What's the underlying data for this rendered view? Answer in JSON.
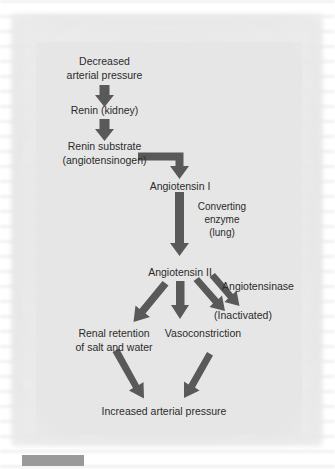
{
  "figure": {
    "type": "flowchart",
    "background_color": "#e6e6e6",
    "arrow_color": "#595959",
    "text_color": "#2b2b2b"
  },
  "nodes": [
    {
      "id": "n1",
      "lines": [
        "Decreased",
        "arterial pressure"
      ]
    },
    {
      "id": "n2",
      "lines": [
        "Renin (kidney)"
      ]
    },
    {
      "id": "n3",
      "lines": [
        "Renin substrate",
        "(angiotensinogen)"
      ]
    },
    {
      "id": "n4",
      "lines": [
        "Angiotensin I"
      ]
    },
    {
      "id": "n5",
      "lines": [
        "Converting",
        "enzyme",
        "(lung)"
      ]
    },
    {
      "id": "n6",
      "lines": [
        "Angiotensin II"
      ]
    },
    {
      "id": "n7",
      "lines": [
        "Angiotensinase"
      ]
    },
    {
      "id": "n8",
      "lines": [
        "(Inactivated)"
      ]
    },
    {
      "id": "n9",
      "lines": [
        "Renal retention",
        "of salt and water"
      ]
    },
    {
      "id": "n10",
      "lines": [
        "Vasoconstriction"
      ]
    },
    {
      "id": "n11",
      "lines": [
        "Increased arterial pressure"
      ]
    }
  ],
  "edges": [
    {
      "from": "n1",
      "to": "n2",
      "style": "straight-down"
    },
    {
      "from": "n2",
      "to": "n3",
      "style": "straight-down"
    },
    {
      "from": "n3",
      "to": "n4",
      "style": "elbow-right-down"
    },
    {
      "from": "n4",
      "to": "n6",
      "style": "straight-down",
      "label": "n5"
    },
    {
      "from": "n6",
      "to": "n9",
      "style": "diagonal-left-down"
    },
    {
      "from": "n6",
      "to": "n10",
      "style": "straight-down"
    },
    {
      "from": "n6",
      "to": "n8",
      "style": "diagonal-right-down"
    },
    {
      "from": "n7",
      "to": "n8",
      "style": "diagonal-right-down"
    },
    {
      "from": "n9",
      "to": "n11",
      "style": "diagonal-right-down"
    },
    {
      "from": "n10",
      "to": "n11",
      "style": "diagonal-left-down"
    }
  ],
  "caption": {
    "bar_label": ""
  }
}
